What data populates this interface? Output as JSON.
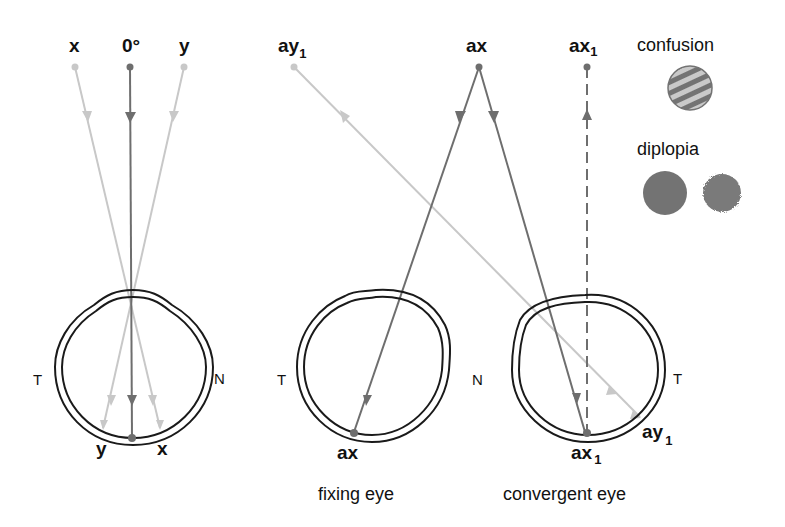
{
  "colors": {
    "dark_ray": "#6e6e6e",
    "light_ray": "#c8c8c8",
    "eye_outline": "#1a1a1a",
    "text": "#111111",
    "disc_fill": "#737373",
    "stripe_light": "#c9c9c9"
  },
  "left_diagram": {
    "top_labels": {
      "x": "x",
      "center": "0°",
      "y": "y"
    },
    "side_labels": {
      "temporal": "T",
      "nasal": "N"
    },
    "retina_labels": {
      "y": "y",
      "x": "x"
    }
  },
  "fixing_eye": {
    "source_label": "ay",
    "source_label_sub": "1",
    "fixation_label": "ax",
    "side_labels": {
      "temporal": "T",
      "nasal": "N"
    },
    "retina_label": "ax",
    "caption": "fixing eye"
  },
  "convergent_eye": {
    "source_label": "ax",
    "source_label_sub": "1",
    "side_labels": {
      "temporal": "T"
    },
    "retina_label_ax": "ax",
    "retina_label_ax_sub": "1",
    "retina_label_ay": "ay",
    "retina_label_ay_sub": "1",
    "caption": "convergent eye"
  },
  "legend": {
    "confusion_label": "confusion",
    "diplopia_label": "diplopia"
  }
}
